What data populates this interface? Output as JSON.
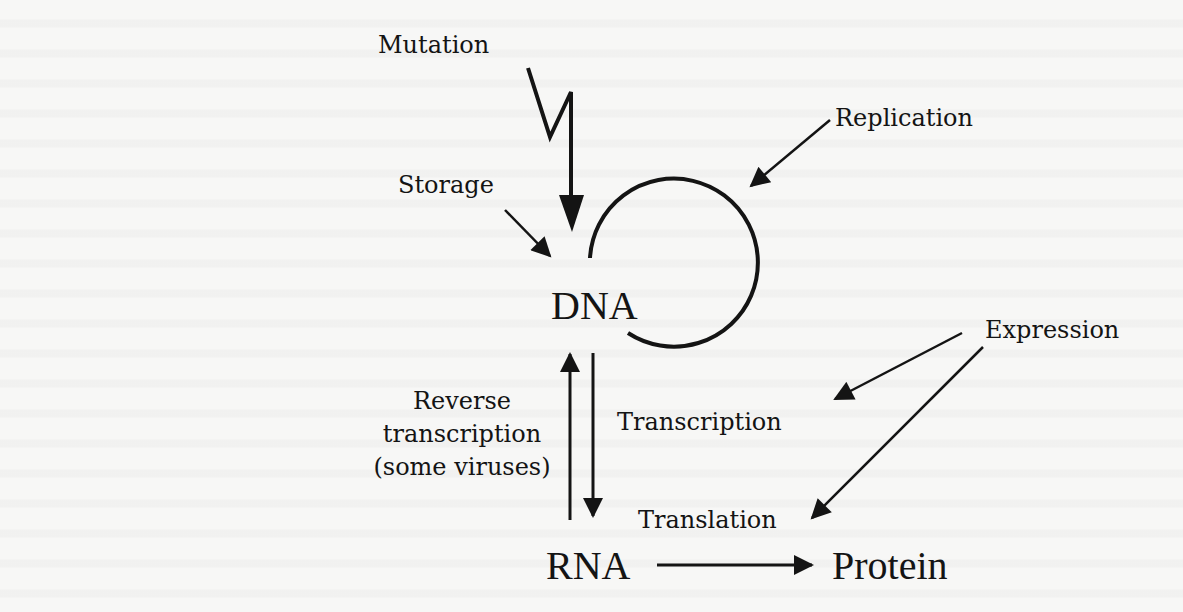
{
  "diagram": {
    "nodes": {
      "dna": "DNA",
      "rna": "RNA",
      "protein": "Protein"
    },
    "labels": {
      "mutation": "Mutation",
      "storage": "Storage",
      "replication": "Replication",
      "expression": "Expression",
      "transcription": "Transcription",
      "translation": "Translation",
      "reverse_transcription": [
        "Reverse",
        "transcription",
        "(some viruses)"
      ]
    },
    "edges": [
      {
        "from": "Mutation",
        "to": "DNA",
        "style": "zigzag-arrow"
      },
      {
        "from": "Storage",
        "to": "DNA",
        "style": "arrow"
      },
      {
        "from": "DNA",
        "to": "DNA",
        "label": "Replication",
        "style": "circular-arc"
      },
      {
        "from": "DNA",
        "to": "RNA",
        "label": "Transcription",
        "style": "arrow"
      },
      {
        "from": "RNA",
        "to": "DNA",
        "label": "Reverse transcription (some viruses)",
        "style": "arrow"
      },
      {
        "from": "RNA",
        "to": "Protein",
        "label": "Translation",
        "style": "arrow"
      },
      {
        "from": "Expression",
        "to": "Transcription",
        "style": "arrow"
      },
      {
        "from": "Expression",
        "to": "Translation",
        "style": "arrow"
      }
    ],
    "colors": {
      "ink": "#141414",
      "paper": "#f7f7f6"
    }
  }
}
